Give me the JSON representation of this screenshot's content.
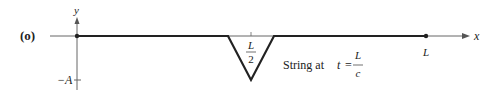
{
  "figure": {
    "panel_label": "(o)",
    "y_axis_label": "y",
    "x_axis_label": "x",
    "neg_amplitude_label": "−A",
    "midpoint_label_num": "L",
    "midpoint_label_den": "2",
    "end_label": "L",
    "caption_text": "String at",
    "caption_var": "t",
    "caption_eq": "=",
    "caption_frac_num": "L",
    "caption_frac_den": "c",
    "colors": {
      "axis": "#555555",
      "string": "#222222",
      "text": "#222222"
    }
  }
}
